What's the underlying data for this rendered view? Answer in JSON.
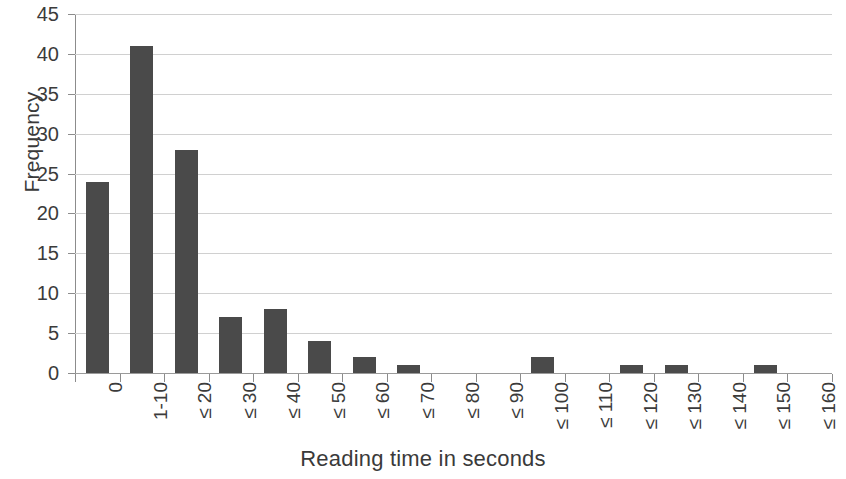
{
  "chart_data": {
    "type": "bar",
    "title": "",
    "xlabel": "Reading time in seconds",
    "ylabel": "Frequency",
    "categories": [
      "0",
      "1-10",
      "≤ 20",
      "≤ 30",
      "≤ 40",
      "≤ 50",
      "≤ 60",
      "≤ 70",
      "≤ 80",
      "≤ 90",
      "≤ 100",
      "≤ 110",
      "≤ 120",
      "≤ 130",
      "≤ 140",
      "≤ 150",
      "≤ 160"
    ],
    "values": [
      24,
      41,
      28,
      7,
      8,
      4,
      2,
      1,
      0,
      0,
      2,
      0,
      1,
      1,
      0,
      1,
      0
    ],
    "ylim": [
      0,
      45
    ],
    "ytick_step": 5,
    "yticks": [
      "0",
      "5",
      "10",
      "15",
      "20",
      "25",
      "30",
      "35",
      "40",
      "45"
    ],
    "grid": "horizontal",
    "legend": "none",
    "bar_color": "#4a4a4a",
    "gridline_color": "#d0d0d0",
    "axis_color": "#8c8c8c",
    "background_color": "#ffffff"
  }
}
